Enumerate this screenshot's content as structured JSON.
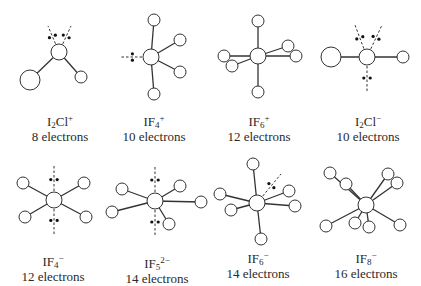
{
  "diagram": {
    "stroke_color": "#333333",
    "atom_fill": "#ffffff",
    "molecules": [
      {
        "id": "I2Cl-plus",
        "formula_base": "I",
        "formula_sub": "2",
        "formula_rest": "Cl",
        "formula_charge": "+",
        "electrons": "8 electrons",
        "label_x": 10,
        "label_y": 114,
        "center": {
          "x": 59,
          "y": 52,
          "r": 8
        },
        "atoms": [
          {
            "x": 30,
            "y": 80,
            "r": 10
          },
          {
            "x": 81,
            "y": 77,
            "r": 6
          }
        ],
        "lone_pairs": [
          {
            "x": 48,
            "y": 26
          },
          {
            "x": 71,
            "y": 26
          }
        ]
      },
      {
        "id": "IF4-plus",
        "formula_base": "IF",
        "formula_sub": "4",
        "formula_rest": "",
        "formula_charge": "+",
        "electrons": "10 electrons",
        "label_x": 104,
        "label_y": 114,
        "center": {
          "x": 151,
          "y": 57,
          "r": 8
        },
        "atoms": [
          {
            "x": 154,
            "y": 20,
            "r": 6
          },
          {
            "x": 180,
            "y": 40,
            "r": 6
          },
          {
            "x": 180,
            "y": 72,
            "r": 6
          },
          {
            "x": 154,
            "y": 94,
            "r": 6
          }
        ],
        "lone_pairs": [
          {
            "x": 120,
            "y": 57
          }
        ]
      },
      {
        "id": "IF6-plus",
        "formula_base": "IF",
        "formula_sub": "6",
        "formula_rest": "",
        "formula_charge": "+",
        "electrons": "12 electrons",
        "label_x": 209,
        "label_y": 114,
        "center": {
          "x": 258,
          "y": 56,
          "r": 8
        },
        "atoms": [
          {
            "x": 258,
            "y": 21,
            "r": 6
          },
          {
            "x": 288,
            "y": 46,
            "r": 6
          },
          {
            "x": 296,
            "y": 56,
            "r": 6
          },
          {
            "x": 224,
            "y": 56,
            "r": 6
          },
          {
            "x": 232,
            "y": 66,
            "r": 6
          },
          {
            "x": 258,
            "y": 92,
            "r": 6
          }
        ],
        "lone_pairs": []
      },
      {
        "id": "I2Cl-minus",
        "formula_base": "I",
        "formula_sub": "2",
        "formula_rest": "Cl",
        "formula_charge": "−",
        "electrons": "10 electrons",
        "label_x": 318,
        "label_y": 114,
        "center": {
          "x": 367,
          "y": 57,
          "r": 8
        },
        "atoms": [
          {
            "x": 331,
            "y": 57,
            "r": 10
          },
          {
            "x": 403,
            "y": 57,
            "r": 6
          }
        ],
        "lone_pairs": [
          {
            "x": 355,
            "y": 25
          },
          {
            "x": 382,
            "y": 25
          },
          {
            "x": 367,
            "y": 92
          }
        ]
      },
      {
        "id": "IF4-minus",
        "formula_base": "IF",
        "formula_sub": "4",
        "formula_rest": "",
        "formula_charge": "−",
        "electrons": "12 electrons",
        "label_x": 3,
        "label_y": 254,
        "center": {
          "x": 54,
          "y": 200,
          "r": 8
        },
        "atoms": [
          {
            "x": 23,
            "y": 183,
            "r": 6
          },
          {
            "x": 84,
            "y": 183,
            "r": 6
          },
          {
            "x": 25,
            "y": 217,
            "r": 6
          },
          {
            "x": 86,
            "y": 217,
            "r": 6
          }
        ],
        "lone_pairs": [
          {
            "x": 54,
            "y": 166
          },
          {
            "x": 54,
            "y": 234
          }
        ]
      },
      {
        "id": "IF5-2minus",
        "formula_base": "IF",
        "formula_sub": "5",
        "formula_rest": "",
        "formula_charge": "2−",
        "electrons": "14 electrons",
        "label_x": 107,
        "label_y": 256,
        "center": {
          "x": 155,
          "y": 201,
          "r": 8
        },
        "atoms": [
          {
            "x": 122,
            "y": 189,
            "r": 6
          },
          {
            "x": 112,
            "y": 212,
            "r": 6
          },
          {
            "x": 180,
            "y": 186,
            "r": 6
          },
          {
            "x": 201,
            "y": 202,
            "r": 6
          },
          {
            "x": 169,
            "y": 224,
            "r": 6
          }
        ],
        "lone_pairs": [
          {
            "x": 155,
            "y": 166
          },
          {
            "x": 155,
            "y": 236
          }
        ]
      },
      {
        "id": "IF6-minus",
        "formula_base": "IF",
        "formula_sub": "6",
        "formula_rest": "",
        "formula_charge": "−",
        "electrons": "14 electrons",
        "label_x": 208,
        "label_y": 251,
        "center": {
          "x": 257,
          "y": 203,
          "r": 8
        },
        "atoms": [
          {
            "x": 253,
            "y": 164,
            "r": 6
          },
          {
            "x": 220,
            "y": 194,
            "r": 6
          },
          {
            "x": 231,
            "y": 210,
            "r": 6
          },
          {
            "x": 289,
            "y": 191,
            "r": 6
          },
          {
            "x": 295,
            "y": 206,
            "r": 6
          },
          {
            "x": 261,
            "y": 239,
            "r": 6
          }
        ],
        "lone_pairs": [
          {
            "x": 281,
            "y": 174
          }
        ]
      },
      {
        "id": "IF8-minus",
        "formula_base": "IF",
        "formula_sub": "8",
        "formula_rest": "",
        "formula_charge": "−",
        "electrons": "16 electrons",
        "label_x": 316,
        "label_y": 251,
        "center": {
          "x": 366,
          "y": 205,
          "r": 8
        },
        "atoms": [
          {
            "x": 330,
            "y": 173,
            "r": 6
          },
          {
            "x": 346,
            "y": 184,
            "r": 6
          },
          {
            "x": 388,
            "y": 174,
            "r": 6
          },
          {
            "x": 397,
            "y": 183,
            "r": 6
          },
          {
            "x": 326,
            "y": 226,
            "r": 6
          },
          {
            "x": 355,
            "y": 223,
            "r": 6
          },
          {
            "x": 369,
            "y": 227,
            "r": 6
          },
          {
            "x": 400,
            "y": 225,
            "r": 6
          }
        ],
        "lone_pairs": []
      }
    ]
  }
}
